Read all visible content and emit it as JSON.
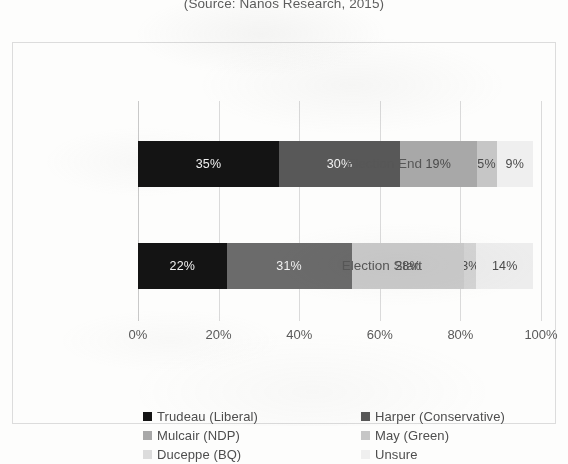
{
  "source_note": "(Source: Nanos Research, 2015)",
  "axis": {
    "xticks": [
      "0%",
      "20%",
      "40%",
      "60%",
      "80%",
      "100%"
    ],
    "categories": [
      "Election End",
      "Election Start"
    ]
  },
  "legend": {
    "items": [
      {
        "label": "Trudeau (Liberal)",
        "color": "#141414"
      },
      {
        "label": "Harper (Conservative)",
        "color": "#585858"
      },
      {
        "label": "Mulcair (NDP)",
        "color": "#a8a8a8"
      },
      {
        "label": "May (Green)",
        "color": "#c6c6c6"
      },
      {
        "label": "Duceppe (BQ)",
        "color": "#dcdcdc"
      },
      {
        "label": "Unsure",
        "color": "#efefef"
      }
    ]
  },
  "chart_data": {
    "type": "bar",
    "orientation": "horizontal",
    "stacked": true,
    "normalized_percent": true,
    "title": "(Source: Nanos Research, 2015)",
    "xlabel": "",
    "ylabel": "",
    "xlim": [
      0,
      100
    ],
    "grid": true,
    "legend_position": "bottom",
    "categories": [
      "Election End",
      "Election Start"
    ],
    "series": [
      {
        "name": "Trudeau (Liberal)",
        "color": "#141414",
        "values": [
          35,
          22
        ],
        "labels": [
          "35%",
          "22%"
        ]
      },
      {
        "name": "Harper (Conservative)",
        "color": "#585858",
        "values": [
          30,
          31
        ],
        "labels": [
          "30%",
          "31%"
        ]
      },
      {
        "name": "Mulcair (NDP)",
        "color": "#a8a8a8",
        "values": [
          19,
          28
        ],
        "labels": [
          "19%",
          "28%"
        ]
      },
      {
        "name": "May (Green)",
        "color": "#c6c6c6",
        "values": [
          5,
          3
        ],
        "labels": [
          "5%",
          "3%"
        ]
      },
      {
        "name": "Duceppe (BQ)",
        "color": "#dcdcdc",
        "values": [
          0,
          0
        ],
        "labels": [
          "",
          ""
        ]
      },
      {
        "name": "Unsure",
        "color": "#efefef",
        "values": [
          9,
          14
        ],
        "labels": [
          "9%",
          "14%"
        ]
      }
    ],
    "rows": [
      {
        "category": "Election End",
        "segments": [
          {
            "name": "Trudeau (Liberal)",
            "value": 35,
            "label": "35%",
            "color": "#141414",
            "label_color": "light"
          },
          {
            "name": "Harper (Conservative)",
            "value": 30,
            "label": "30%",
            "color": "#585858",
            "label_color": "light"
          },
          {
            "name": "Mulcair (NDP)",
            "value": 19,
            "label": "19%",
            "color": "#a8a8a8",
            "label_color": "dark"
          },
          {
            "name": "May (Green)",
            "value": 5,
            "label": "5%",
            "color": "#c6c6c6",
            "label_color": "dark"
          },
          {
            "name": "Unsure",
            "value": 9,
            "label": "9%",
            "color": "#efefef",
            "label_color": "dark"
          }
        ]
      },
      {
        "category": "Election Start",
        "segments": [
          {
            "name": "Trudeau (Liberal)",
            "value": 22,
            "label": "22%",
            "color": "#141414",
            "label_color": "light"
          },
          {
            "name": "Harper (Conservative)",
            "value": 31,
            "label": "31%",
            "color": "#6b6b6b",
            "label_color": "light"
          },
          {
            "name": "Mulcair (NDP)",
            "value": 28,
            "label": "28%",
            "color": "#cacaca",
            "label_color": "dark"
          },
          {
            "name": "May (Green)",
            "value": 3,
            "label": "3%",
            "color": "#d4d4d4",
            "label_color": "dark"
          },
          {
            "name": "Unsure",
            "value": 14,
            "label": "14%",
            "color": "#ededed",
            "label_color": "dark"
          }
        ]
      }
    ]
  }
}
